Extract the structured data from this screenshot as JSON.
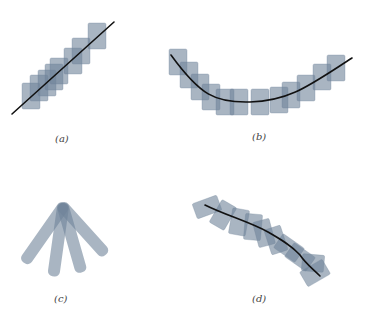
{
  "figure": {
    "colors": {
      "patch_fill": "#6f8499",
      "patch_opacity": 0.6,
      "curve": "#111111",
      "label": "#444444"
    },
    "panels": [
      {
        "id": "a",
        "label": "(a)",
        "label_pos": [
          60,
          140
        ],
        "description": "straight line covered by overlapping axis-aligned squares",
        "curve": "M12,114 L114,22",
        "rects": [
          {
            "x": 22,
            "y": 83,
            "w": 18,
            "h": 26,
            "r": 0
          },
          {
            "x": 30,
            "y": 75,
            "w": 18,
            "h": 26,
            "r": 0
          },
          {
            "x": 38,
            "y": 70,
            "w": 18,
            "h": 26,
            "r": 0
          },
          {
            "x": 45,
            "y": 64,
            "w": 18,
            "h": 26,
            "r": 0
          },
          {
            "x": 50,
            "y": 58,
            "w": 18,
            "h": 26,
            "r": 0
          },
          {
            "x": 64,
            "y": 48,
            "w": 18,
            "h": 26,
            "r": 0
          },
          {
            "x": 72,
            "y": 38,
            "w": 18,
            "h": 26,
            "r": 0
          },
          {
            "x": 88,
            "y": 23,
            "w": 18,
            "h": 26,
            "r": 0
          }
        ]
      },
      {
        "id": "b",
        "label": "(b)",
        "label_pos": [
          258,
          140
        ],
        "description": "curved line covered by axis-aligned squares",
        "curve": "M171,55 C200,95 215,103 250,102 C290,101 310,85 352,58",
        "rects": [
          {
            "x": 169,
            "y": 49,
            "w": 18,
            "h": 26,
            "r": 0
          },
          {
            "x": 180,
            "y": 62,
            "w": 18,
            "h": 26,
            "r": 0
          },
          {
            "x": 191,
            "y": 74,
            "w": 18,
            "h": 26,
            "r": 0
          },
          {
            "x": 202,
            "y": 84,
            "w": 18,
            "h": 26,
            "r": 0
          },
          {
            "x": 216,
            "y": 89,
            "w": 18,
            "h": 26,
            "r": 0
          },
          {
            "x": 230,
            "y": 89,
            "w": 18,
            "h": 26,
            "r": 0
          },
          {
            "x": 251,
            "y": 89,
            "w": 18,
            "h": 26,
            "r": 0
          },
          {
            "x": 270,
            "y": 87,
            "w": 18,
            "h": 26,
            "r": 0
          },
          {
            "x": 282,
            "y": 82,
            "w": 18,
            "h": 26,
            "r": 0
          },
          {
            "x": 297,
            "y": 75,
            "w": 18,
            "h": 26,
            "r": 0
          },
          {
            "x": 313,
            "y": 64,
            "w": 18,
            "h": 26,
            "r": 0
          },
          {
            "x": 327,
            "y": 55,
            "w": 18,
            "h": 26,
            "r": 0
          }
        ]
      },
      {
        "id": "c",
        "label": "(c)",
        "label_pos": [
          60,
          300
        ],
        "description": "four elongated bars fanning out from a common pivot",
        "pivot": [
          63,
          207
        ],
        "bars": [
          {
            "angle": 35,
            "length": 72,
            "width": 12
          },
          {
            "angle": 8,
            "length": 74,
            "width": 12
          },
          {
            "angle": -16,
            "length": 72,
            "width": 12
          },
          {
            "angle": -42,
            "length": 68,
            "width": 12
          }
        ]
      },
      {
        "id": "d",
        "label": "(d)",
        "label_pos": [
          258,
          300
        ],
        "description": "curve covered by rotated rectangles aligned with local direction",
        "curve": "M205,205 C225,215 250,222 268,232 C282,240 292,246 300,255 C306,264 312,268 320,276",
        "rects": [
          {
            "cx": 207,
            "cy": 207,
            "w": 26,
            "h": 16,
            "r": -20
          },
          {
            "cx": 223,
            "cy": 215,
            "w": 26,
            "h": 17,
            "r": -60
          },
          {
            "cx": 239,
            "cy": 222,
            "w": 17,
            "h": 26,
            "r": 10
          },
          {
            "cx": 253,
            "cy": 227,
            "w": 17,
            "h": 26,
            "r": 5
          },
          {
            "cx": 264,
            "cy": 233,
            "w": 17,
            "h": 26,
            "r": -15
          },
          {
            "cx": 276,
            "cy": 240,
            "w": 17,
            "h": 26,
            "r": -18
          },
          {
            "cx": 289,
            "cy": 248,
            "w": 26,
            "h": 17,
            "r": 35
          },
          {
            "cx": 300,
            "cy": 257,
            "w": 26,
            "h": 17,
            "r": 35
          },
          {
            "cx": 313,
            "cy": 263,
            "w": 22,
            "h": 17,
            "r": 5
          },
          {
            "cx": 315,
            "cy": 273,
            "w": 26,
            "h": 17,
            "r": -30
          }
        ]
      }
    ],
    "caption_faint": "Fig. …"
  }
}
